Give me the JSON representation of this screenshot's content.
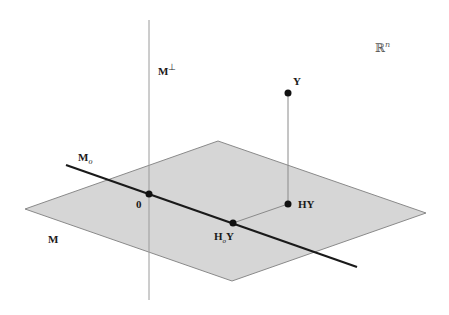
{
  "diagram": {
    "type": "geometric-projection",
    "colors": {
      "background": "#ffffff",
      "plane_fill": "#d6d6d6",
      "plane_edge": "#8a8a8a",
      "line": "#1a1a1a",
      "thin_line": "#9a9a9a",
      "point": "#111111"
    },
    "labels": {
      "space": "ℝ",
      "space_sup": "n",
      "orth_complement": "M",
      "orth_complement_sup": "⊥",
      "subspace_line": "M",
      "subspace_line_sub": "o",
      "plane": "M",
      "origin": "0",
      "y": "Y",
      "hy": "HY",
      "hoy_prefix": "H",
      "hoy_sub": "o",
      "hoy_suffix": "Y"
    },
    "points": {
      "origin": [
        149,
        194
      ],
      "y": [
        288,
        93
      ],
      "hy": [
        288,
        204
      ],
      "hoy": [
        233,
        223
      ]
    },
    "plane_corners": [
      [
        25,
        209
      ],
      [
        218,
        141
      ],
      [
        426,
        213
      ],
      [
        232,
        281
      ]
    ],
    "line_mo": [
      [
        66,
        165
      ],
      [
        357,
        267
      ]
    ],
    "line_mperp": [
      [
        149,
        20
      ],
      [
        149,
        300
      ]
    ]
  }
}
